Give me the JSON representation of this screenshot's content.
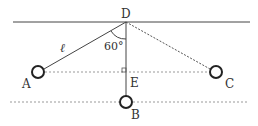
{
  "diagram": {
    "points": {
      "D": {
        "label": "D",
        "x": 126,
        "y": 22
      },
      "A": {
        "label": "A",
        "x": 38,
        "y": 72
      },
      "B": {
        "label": "B",
        "x": 126,
        "y": 102
      },
      "C": {
        "label": "C",
        "x": 216,
        "y": 72
      },
      "E": {
        "label": "E",
        "x": 126,
        "y": 72
      }
    },
    "length_label": "ℓ",
    "angle_label": "60°",
    "right_angle_at": "E",
    "colors": {
      "line": "#444444",
      "dotted": "#999999",
      "text": "#333333",
      "bob": "#222222"
    }
  }
}
